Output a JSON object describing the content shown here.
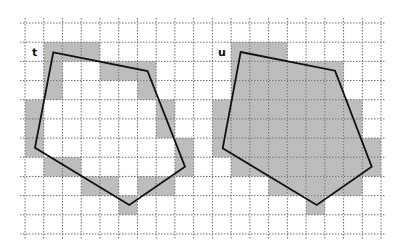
{
  "diagram": {
    "grid": {
      "x0": 25,
      "y0": 23,
      "cols": 19,
      "rows": 11,
      "cell_w": 18.74,
      "cell_h": 19.18,
      "overshoot": 5,
      "line_color": "#6e6e6e",
      "fill_color": "#bdbdbd"
    },
    "figures": [
      {
        "id": "t",
        "label": "t",
        "label_pos": [
          32,
          56
        ],
        "stroke_color": "#111111",
        "polygon": [
          [
            53.3,
            52.3
          ],
          [
            147.5,
            71.0
          ],
          [
            185.0,
            166.7
          ],
          [
            129.3,
            205.0
          ],
          [
            35.0,
            147.7
          ]
        ],
        "shaded_cells": [
          [
            1,
            1
          ],
          [
            1,
            2
          ],
          [
            1,
            3
          ],
          [
            2,
            1
          ],
          [
            2,
            4
          ],
          [
            2,
            5
          ],
          [
            2,
            6
          ],
          [
            3,
            1
          ],
          [
            3,
            6
          ],
          [
            4,
            0
          ],
          [
            4,
            7
          ],
          [
            5,
            0
          ],
          [
            5,
            7
          ],
          [
            6,
            0
          ],
          [
            6,
            8
          ],
          [
            7,
            1
          ],
          [
            7,
            2
          ],
          [
            7,
            8
          ],
          [
            8,
            3
          ],
          [
            8,
            4
          ],
          [
            8,
            6
          ],
          [
            8,
            7
          ],
          [
            9,
            5
          ]
        ]
      },
      {
        "id": "u",
        "label": "u",
        "label_pos": [
          218,
          56
        ],
        "stroke_color": "#111111",
        "polygon": [
          [
            240.7,
            52.0
          ],
          [
            335.0,
            70.7
          ],
          [
            371.7,
            166.7
          ],
          [
            316.7,
            205.0
          ],
          [
            222.7,
            148.3
          ]
        ],
        "shaded_cells": [
          [
            1,
            11
          ],
          [
            1,
            12
          ],
          [
            1,
            13
          ],
          [
            2,
            11
          ],
          [
            2,
            12
          ],
          [
            2,
            13
          ],
          [
            2,
            14
          ],
          [
            2,
            15
          ],
          [
            2,
            16
          ],
          [
            3,
            11
          ],
          [
            3,
            12
          ],
          [
            3,
            13
          ],
          [
            3,
            14
          ],
          [
            3,
            15
          ],
          [
            3,
            16
          ],
          [
            4,
            10
          ],
          [
            4,
            11
          ],
          [
            4,
            12
          ],
          [
            4,
            13
          ],
          [
            4,
            14
          ],
          [
            4,
            15
          ],
          [
            4,
            16
          ],
          [
            4,
            17
          ],
          [
            5,
            10
          ],
          [
            5,
            11
          ],
          [
            5,
            12
          ],
          [
            5,
            13
          ],
          [
            5,
            14
          ],
          [
            5,
            15
          ],
          [
            5,
            16
          ],
          [
            5,
            17
          ],
          [
            6,
            10
          ],
          [
            6,
            11
          ],
          [
            6,
            12
          ],
          [
            6,
            13
          ],
          [
            6,
            14
          ],
          [
            6,
            15
          ],
          [
            6,
            16
          ],
          [
            6,
            17
          ],
          [
            6,
            18
          ],
          [
            7,
            11
          ],
          [
            7,
            12
          ],
          [
            7,
            13
          ],
          [
            7,
            14
          ],
          [
            7,
            15
          ],
          [
            7,
            16
          ],
          [
            7,
            17
          ],
          [
            7,
            18
          ],
          [
            8,
            13
          ],
          [
            8,
            14
          ],
          [
            8,
            15
          ],
          [
            8,
            16
          ],
          [
            8,
            17
          ],
          [
            9,
            15
          ]
        ]
      }
    ]
  }
}
